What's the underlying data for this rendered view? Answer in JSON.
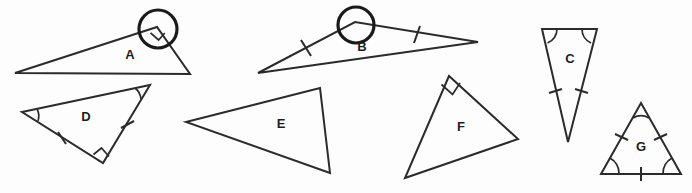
{
  "figure": {
    "background_color": "#fdfdfd",
    "stroke_color": "#2b2b2b",
    "label_color": "#1e1e1e",
    "width": 692,
    "height": 193
  },
  "triangles": [
    {
      "id": "A",
      "label": "A",
      "label_x": 130,
      "label_y": 56,
      "points": "15,73 157,27 190,74",
      "classification": "right scalene",
      "has_right_angle_mark": true,
      "right_angle_vertex": "top",
      "circled": true,
      "tick_marks": 0,
      "angle_arcs": 0
    },
    {
      "id": "B",
      "label": "B",
      "label_x": 362,
      "label_y": 48,
      "points": "258,73 355,22 478,42",
      "classification": "obtuse isosceles",
      "has_right_angle_mark": false,
      "circled": true,
      "tick_marks": 2,
      "angle_arcs": 0
    },
    {
      "id": "C",
      "label": "C",
      "label_x": 570,
      "label_y": 60,
      "points": "542,29 597,29 568,142",
      "classification": "acute isosceles",
      "has_right_angle_mark": false,
      "circled": false,
      "tick_marks": 2,
      "angle_arcs": 2
    },
    {
      "id": "D",
      "label": "D",
      "label_x": 86,
      "label_y": 118,
      "points": "22,112 150,85 103,163",
      "classification": "right triangle",
      "has_right_angle_mark": true,
      "right_angle_vertex": "bottom",
      "circled": false,
      "tick_marks": 2,
      "angle_arcs": 2
    },
    {
      "id": "E",
      "label": "E",
      "label_x": 281,
      "label_y": 125,
      "points": "186,122 320,88 330,173",
      "classification": "scalene",
      "has_right_angle_mark": false,
      "circled": false,
      "tick_marks": 0,
      "angle_arcs": 0
    },
    {
      "id": "F",
      "label": "F",
      "label_x": 461,
      "label_y": 128,
      "points": "449,76 405,178 518,139",
      "classification": "right scalene",
      "has_right_angle_mark": true,
      "right_angle_vertex": "top",
      "circled": false,
      "tick_marks": 0,
      "angle_arcs": 0
    },
    {
      "id": "G",
      "label": "G",
      "label_x": 641,
      "label_y": 148,
      "points": "641,103 681,174 601,174",
      "classification": "equilateral",
      "has_right_angle_mark": false,
      "circled": false,
      "tick_marks": 3,
      "angle_arcs": 3
    }
  ]
}
